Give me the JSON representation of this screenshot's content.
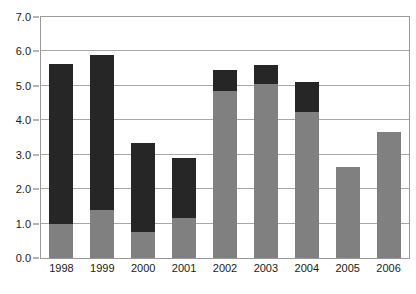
{
  "chart_data": {
    "type": "bar",
    "stacked": true,
    "title": "",
    "subtitle": "",
    "xlabel": "",
    "ylabel": "",
    "categories": [
      "1998",
      "1999",
      "2000",
      "2001",
      "2002",
      "2003",
      "2004",
      "2005",
      "2006"
    ],
    "series": [
      {
        "name": "Cash and savings",
        "color": "#808080",
        "values": [
          1.0,
          1.4,
          0.75,
          1.15,
          4.85,
          5.05,
          4.25,
          2.65,
          3.65
        ]
      },
      {
        "name": "Investments",
        "color": "#262626",
        "values": [
          4.65,
          4.5,
          2.6,
          1.75,
          0.6,
          0.55,
          0.85,
          0.0,
          0.0
        ]
      }
    ],
    "totals": [
      5.65,
      5.9,
      3.35,
      2.9,
      5.45,
      5.6,
      5.1,
      2.65,
      3.65
    ],
    "ylim": [
      0.0,
      7.0
    ],
    "ytick_step": 1.0,
    "ytick_labels": [
      "0.0",
      "1.0",
      "2.0",
      "3.0",
      "4.0",
      "5.0",
      "6.0",
      "7.0"
    ],
    "grid": true,
    "grid_axis": "y",
    "legend_position": "top-center"
  },
  "legend": {
    "entries": [
      {
        "label": "Investments",
        "color": "#262626"
      },
      {
        "label": "Cash and savings",
        "color": "#808080"
      }
    ]
  }
}
